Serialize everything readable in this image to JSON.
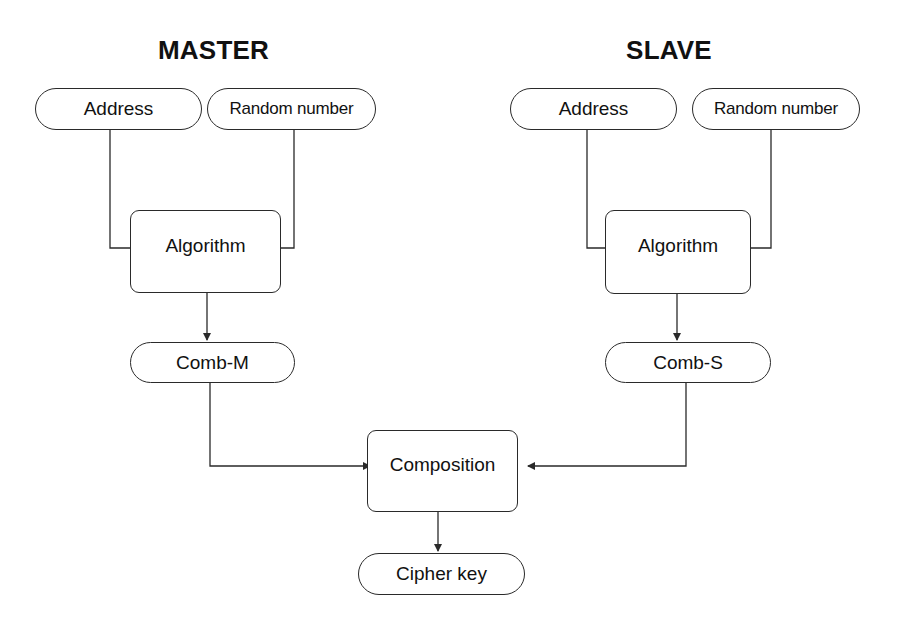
{
  "diagram": {
    "colors": {
      "stroke": "#2a2a2a",
      "text": "#111111",
      "background": "#ffffff"
    },
    "headings": {
      "master": "MASTER",
      "slave": "SLAVE"
    },
    "master": {
      "address": "Address",
      "random_number": "Random number",
      "algorithm": "Algorithm",
      "comb": "Comb-M"
    },
    "slave": {
      "address": "Address",
      "random_number": "Random number",
      "algorithm": "Algorithm",
      "comb": "Comb-S"
    },
    "composition": "Composition",
    "cipher_key": "Cipher key",
    "edges": [
      {
        "from": "master.address",
        "to": "master.algorithm"
      },
      {
        "from": "master.random_number",
        "to": "master.algorithm"
      },
      {
        "from": "master.algorithm",
        "to": "master.comb"
      },
      {
        "from": "slave.address",
        "to": "slave.algorithm"
      },
      {
        "from": "slave.random_number",
        "to": "slave.algorithm"
      },
      {
        "from": "slave.algorithm",
        "to": "slave.comb"
      },
      {
        "from": "master.comb",
        "to": "composition"
      },
      {
        "from": "slave.comb",
        "to": "composition"
      },
      {
        "from": "composition",
        "to": "cipher_key"
      }
    ]
  }
}
